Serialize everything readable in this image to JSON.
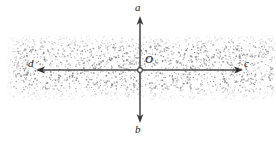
{
  "figure": {
    "type": "geometry-diagram",
    "width": 276,
    "height": 141,
    "background_color": "#ffffff",
    "ink_color": "#4d4d4d",
    "label_color": "#1a1a1a",
    "stipple_color": "#8a8a8a"
  },
  "labels": {
    "top": "a",
    "bottom": "b",
    "left": "d",
    "right": "c",
    "origin": "O"
  },
  "geometry": {
    "origin": {
      "x": 140,
      "y": 70
    },
    "vertical_axis": {
      "name": "ab-axis",
      "x": 140,
      "y_top": 18,
      "y_bottom": 121,
      "arrowheads": [
        "top",
        "bottom"
      ]
    },
    "horizontal_axis": {
      "name": "dc-axis",
      "y": 70,
      "x_left": 38,
      "x_right": 241,
      "arrowheads": [
        "left",
        "right"
      ]
    },
    "band": {
      "name": "stippled-band",
      "x_start": 8,
      "x_end": 273,
      "y_top": 37,
      "y_bottom": 99,
      "description": "randomly stippled gray region with soft faded top and bottom edges"
    },
    "origin_marker": {
      "shape": "open-circle",
      "radius": 2.4
    }
  }
}
